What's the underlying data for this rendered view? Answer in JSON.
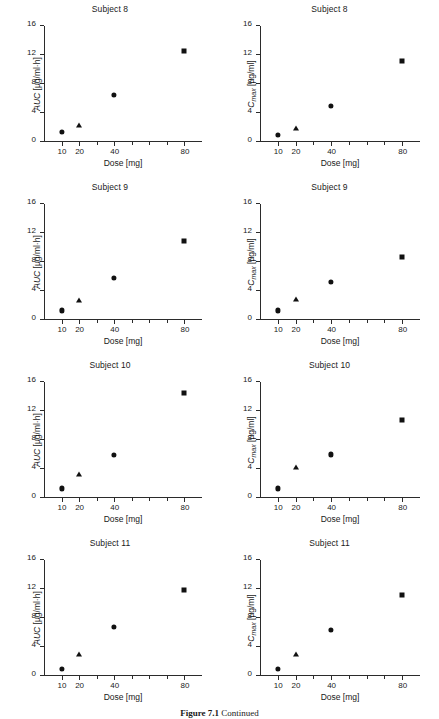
{
  "figure": {
    "caption_bold": "Figure 7.1",
    "caption_rest": "Continued",
    "background": "#ffffff",
    "marker_color": "#111111",
    "axis_color": "#2b2b2b"
  },
  "axes": {
    "xlabel": "Dose [mg]",
    "ylabel_auc_main": "AUC",
    "ylabel_auc_units": " [µg/ml·h]",
    "ylabel_cmax_main": "C",
    "ylabel_cmax_sub": "max",
    "ylabel_cmax_units": " [µg/ml]",
    "yticks": [
      0,
      4,
      8,
      12,
      16
    ],
    "ylim": [
      0,
      16
    ],
    "xticks": [
      10,
      20,
      40,
      80
    ],
    "xlim": [
      0,
      90
    ],
    "grid": false
  },
  "chart_data": [
    {
      "type": "scatter",
      "title": "Subject 8",
      "panel": "left",
      "xlabel": "Dose [mg]",
      "ylabel": "AUC [µg/ml·h]",
      "x": [
        10,
        20,
        40,
        80
      ],
      "values": [
        1.4,
        2.4,
        6.5,
        12.6
      ],
      "markers": [
        "circle",
        "triangle",
        "circle",
        "square"
      ],
      "xlim": [
        0,
        90
      ],
      "ylim": [
        0,
        16
      ]
    },
    {
      "type": "scatter",
      "title": "Subject 8",
      "panel": "right",
      "xlabel": "Dose [mg]",
      "ylabel": "Cmax [µg/ml]",
      "x": [
        10,
        20,
        40,
        80
      ],
      "values": [
        1.0,
        2.0,
        5.0,
        11.2
      ],
      "markers": [
        "circle",
        "triangle",
        "circle",
        "square"
      ],
      "xlim": [
        0,
        90
      ],
      "ylim": [
        0,
        16
      ]
    },
    {
      "type": "scatter",
      "title": "Subject 9",
      "panel": "left",
      "xlabel": "Dose [mg]",
      "ylabel": "AUC [µg/ml·h]",
      "x": [
        10,
        20,
        40,
        80
      ],
      "values": [
        1.3,
        2.8,
        5.8,
        10.9
      ],
      "markers": [
        "circle",
        "triangle",
        "circle",
        "square"
      ],
      "xlim": [
        0,
        90
      ],
      "ylim": [
        0,
        16
      ]
    },
    {
      "type": "scatter",
      "title": "Subject 9",
      "panel": "right",
      "xlabel": "Dose [mg]",
      "ylabel": "Cmax [µg/ml]",
      "x": [
        10,
        20,
        40,
        80
      ],
      "values": [
        1.3,
        2.9,
        5.2,
        8.7
      ],
      "markers": [
        "circle",
        "triangle",
        "circle",
        "square"
      ],
      "xlim": [
        0,
        90
      ],
      "ylim": [
        0,
        16
      ]
    },
    {
      "type": "scatter",
      "title": "Subject 10",
      "panel": "left",
      "xlabel": "Dose [mg]",
      "ylabel": "AUC [µg/ml·h]",
      "x": [
        10,
        20,
        40,
        80
      ],
      "values": [
        1.3,
        3.3,
        5.9,
        14.5
      ],
      "markers": [
        "circle",
        "triangle",
        "circle",
        "square"
      ],
      "xlim": [
        0,
        90
      ],
      "ylim": [
        0,
        16
      ]
    },
    {
      "type": "scatter",
      "title": "Subject 10",
      "panel": "right",
      "xlabel": "Dose [mg]",
      "ylabel": "Cmax [µg/ml]",
      "x": [
        10,
        20,
        40,
        80
      ],
      "values": [
        1.3,
        4.3,
        6.0,
        10.7
      ],
      "markers": [
        "circle",
        "triangle",
        "circle",
        "square"
      ],
      "xlim": [
        0,
        90
      ],
      "ylim": [
        0,
        16
      ]
    },
    {
      "type": "scatter",
      "title": "Subject 11",
      "panel": "left",
      "xlabel": "Dose [mg]",
      "ylabel": "AUC [µg/ml·h]",
      "x": [
        10,
        20,
        40,
        80
      ],
      "values": [
        1.0,
        3.0,
        6.8,
        11.9
      ],
      "markers": [
        "circle",
        "triangle",
        "circle",
        "square"
      ],
      "xlim": [
        0,
        90
      ],
      "ylim": [
        0,
        16
      ]
    },
    {
      "type": "scatter",
      "title": "Subject 11",
      "panel": "right",
      "xlabel": "Dose [mg]",
      "ylabel": "Cmax [µg/ml]",
      "x": [
        10,
        20,
        40,
        80
      ],
      "values": [
        0.9,
        3.0,
        6.3,
        11.2
      ],
      "markers": [
        "circle",
        "triangle",
        "circle",
        "square"
      ],
      "xlim": [
        0,
        90
      ],
      "ylim": [
        0,
        16
      ]
    }
  ]
}
